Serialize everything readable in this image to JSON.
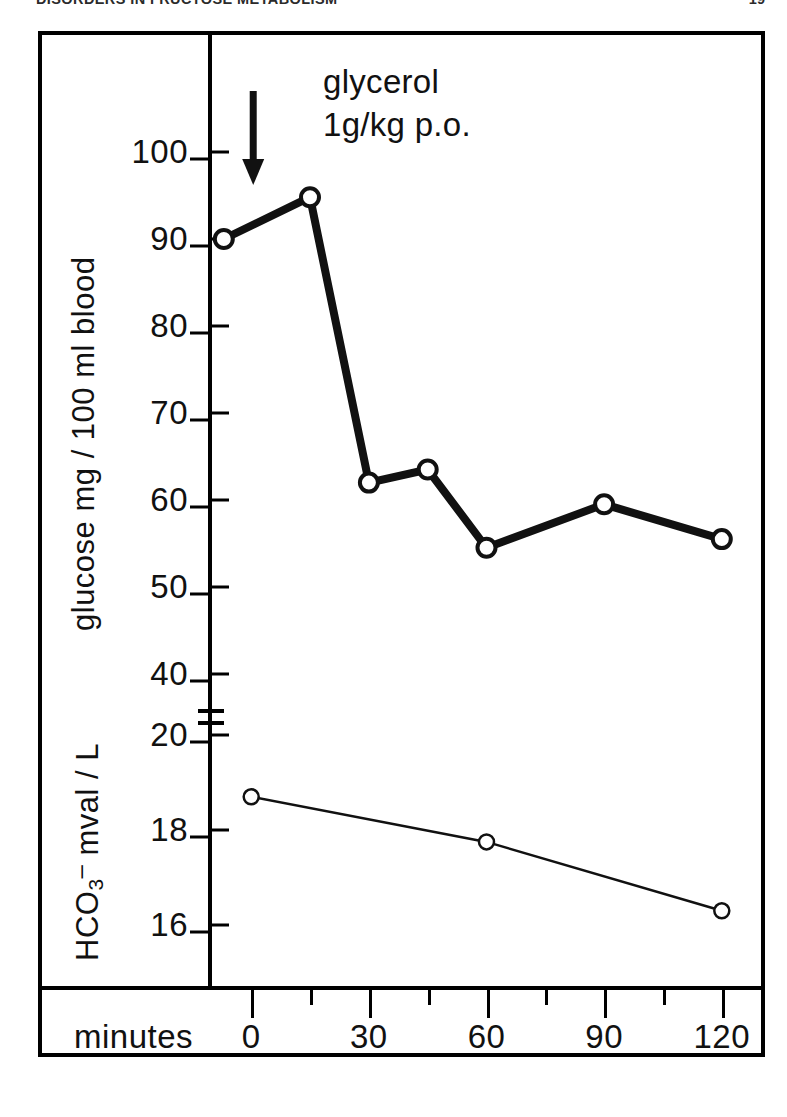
{
  "running_head": {
    "left_text": "DISORDERS IN FRUCTOSE METABOLISM",
    "right_text": "19"
  },
  "annotation": {
    "line1": "glycerol",
    "line2": "1g/kg p.o.",
    "arrow_icon": "down-arrow-icon",
    "arrow_at_minutes": 0
  },
  "axes": {
    "x": {
      "title": "minutes",
      "major_ticks": [
        0,
        30,
        60,
        90,
        120
      ],
      "major_tick_labels": [
        "0",
        "30",
        "60",
        "90",
        "120"
      ],
      "minor_ticks": [
        15,
        45,
        75,
        105
      ],
      "range": [
        -10,
        130
      ]
    },
    "y_top": {
      "title": "glucose  mg / 100 ml blood",
      "title_parts": [
        "glucose",
        "mg / 100 ml blood"
      ],
      "ticks": [
        100,
        90,
        80,
        70,
        60,
        50,
        40
      ],
      "tick_labels": [
        "100",
        "90",
        "80",
        "70",
        "60",
        "50",
        "40"
      ],
      "range": [
        40,
        105
      ]
    },
    "y_bottom": {
      "title": "HCO3- mval / L",
      "title_prefix": "HCO",
      "title_sub": "3",
      "title_sup": "–",
      "title_suffix": " mval / L",
      "ticks": [
        20,
        18,
        16
      ],
      "tick_labels": [
        "20",
        "18",
        "16"
      ],
      "range": [
        15,
        20.5
      ]
    },
    "break_marker": "axis-break-between-40-and-20"
  },
  "chart_data": {
    "type": "line",
    "title": "",
    "xlabel": "minutes",
    "grid": false,
    "legend": "none",
    "series": [
      {
        "name": "glucose",
        "ylabel": "glucose mg / 100 ml blood",
        "panel": "top",
        "marker": "open-circle",
        "line_width": "thick",
        "x": [
          -7,
          15,
          30,
          45,
          60,
          90,
          120
        ],
        "values": [
          90.0,
          94.8,
          62.0,
          63.5,
          54.5,
          59.5,
          55.5
        ],
        "ylim": [
          40,
          105
        ]
      },
      {
        "name": "HCO3- (bicarbonate)",
        "ylabel": "HCO3- mval / L",
        "panel": "bottom",
        "marker": "open-circle",
        "line_width": "thin",
        "x": [
          0,
          60,
          120
        ],
        "values": [
          18.7,
          17.75,
          16.3
        ],
        "ylim": [
          15,
          20.5
        ]
      }
    ],
    "annotations": [
      {
        "text": "glycerol 1g/kg p.o.",
        "x": 0,
        "type": "arrow-down"
      }
    ]
  },
  "colors": {
    "ink": "#111111",
    "paper": "#ffffff"
  }
}
